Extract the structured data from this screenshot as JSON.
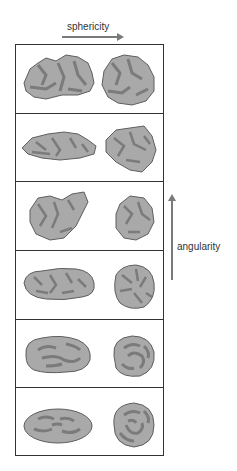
{
  "labels": {
    "horizontal_axis": "sphericity",
    "vertical_axis": "angularity"
  },
  "colors": {
    "rock_fill": "#a9a9a9",
    "rock_shadow": "#7b7b7b",
    "rock_outline": "#5e5e5e",
    "border": "#333333",
    "arrow": "#7a7a7a"
  },
  "rows": [
    {
      "angularity": "very angular",
      "left": "low sphericity",
      "right": "high sphericity"
    },
    {
      "angularity": "angular",
      "left": "low sphericity",
      "right": "high sphericity"
    },
    {
      "angularity": "subangular",
      "left": "low sphericity",
      "right": "high sphericity"
    },
    {
      "angularity": "subrounded",
      "left": "low sphericity",
      "right": "high sphericity"
    },
    {
      "angularity": "rounded",
      "left": "low sphericity",
      "right": "high sphericity"
    },
    {
      "angularity": "well rounded",
      "left": "low sphericity",
      "right": "high sphericity"
    }
  ]
}
